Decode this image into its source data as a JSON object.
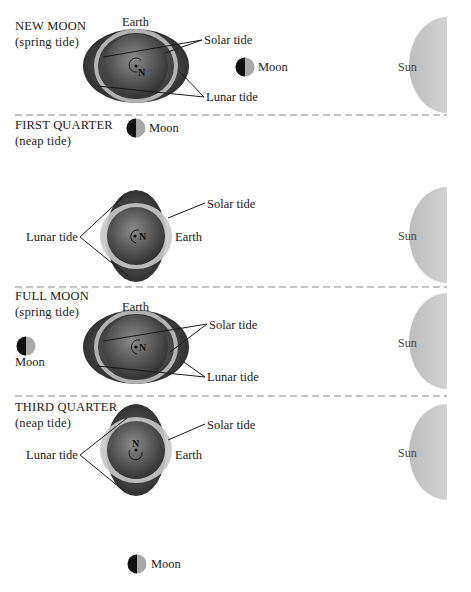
{
  "figure": {
    "colors": {
      "sun": "#c9c9c9",
      "moon_dark": "#111111",
      "moon_light": "#a9a9a9",
      "earth_core": "#5a5a5a",
      "tide_bulge": "#3d3d3d",
      "tide_ring": "#c8c8c8",
      "divider": "#8a8a8a"
    },
    "panels": [
      {
        "phase": "NEW MOON",
        "tide_type": "(spring tide)",
        "labels": {
          "earth": "Earth",
          "solar_tide": "Solar tide",
          "lunar_tide": "Lunar tide",
          "moon": "Moon",
          "sun": "Sun",
          "north": "N"
        }
      },
      {
        "phase": "FIRST QUARTER",
        "tide_type": "(neap tide)",
        "labels": {
          "earth": "Earth",
          "solar_tide": "Solar tide",
          "lunar_tide": "Lunar tide",
          "moon": "Moon",
          "sun": "Sun",
          "north": "N"
        }
      },
      {
        "phase": "FULL MOON",
        "tide_type": "(spring tide)",
        "labels": {
          "earth": "Earth",
          "solar_tide": "Solar tide",
          "lunar_tide": "Lunar tide",
          "moon": "Moon",
          "sun": "Sun",
          "north": "N"
        }
      },
      {
        "phase": "THIRD QUARTER",
        "tide_type": "(neap tide)",
        "labels": {
          "earth": "Earth",
          "solar_tide": "Solar tide",
          "lunar_tide": "Lunar tide",
          "moon": "Moon",
          "sun": "Sun",
          "north": "N"
        }
      }
    ]
  }
}
